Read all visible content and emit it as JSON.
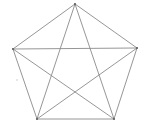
{
  "diagram": {
    "type": "complete-graph-K5",
    "stroke_color": "#8a8a8a",
    "stroke_width": 0.9,
    "vertex_color": "#555555",
    "vertex_radius": 0.9,
    "background": "#ffffff",
    "vertices": [
      {
        "id": "top",
        "x": 75,
        "y": 4
      },
      {
        "id": "right",
        "x": 137,
        "y": 48
      },
      {
        "id": "bottom-right",
        "x": 114,
        "y": 119
      },
      {
        "id": "bottom-left",
        "x": 37,
        "y": 119
      },
      {
        "id": "left",
        "x": 13,
        "y": 49
      }
    ],
    "edges": [
      {
        "from": 0,
        "to": 1,
        "kind": "side"
      },
      {
        "from": 1,
        "to": 2,
        "kind": "side"
      },
      {
        "from": 2,
        "to": 3,
        "kind": "side"
      },
      {
        "from": 3,
        "to": 4,
        "kind": "side"
      },
      {
        "from": 4,
        "to": 0,
        "kind": "side"
      },
      {
        "from": 0,
        "to": 2,
        "kind": "diagonal"
      },
      {
        "from": 0,
        "to": 3,
        "kind": "diagonal"
      },
      {
        "from": 1,
        "to": 3,
        "kind": "diagonal"
      },
      {
        "from": 1,
        "to": 4,
        "kind": "diagonal"
      },
      {
        "from": 2,
        "to": 4,
        "kind": "diagonal"
      }
    ],
    "stray_mark": {
      "x": 17,
      "y": 80,
      "color": "#c8c8c8",
      "radius": 0.8
    }
  }
}
